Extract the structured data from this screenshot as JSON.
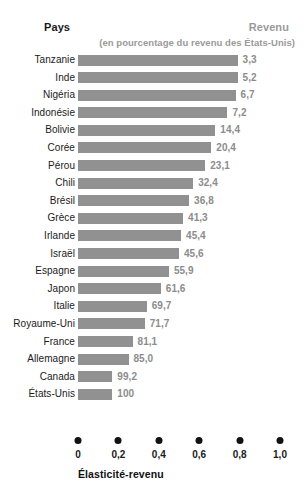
{
  "header": {
    "col_country": "Pays",
    "col_income": "Revenu",
    "col_income_sub": "(en pourcentage du revenu des États-Unis)"
  },
  "axis": {
    "title": "Élasticité-revenu",
    "ticks": [
      "0",
      "0,2",
      "0,4",
      "0,6",
      "0,8",
      "1,0"
    ],
    "tick_values": [
      0,
      0.2,
      0.4,
      0.6,
      0.8,
      1.0
    ]
  },
  "style": {
    "bar_color": "#919191",
    "value_color": "#8c8c8c",
    "label_color": "#1a1a1a",
    "header_muted_color": "#9a9a9a",
    "dot_color": "#111111",
    "background": "#ffffff"
  },
  "chart_data": {
    "type": "bar",
    "orientation": "horizontal",
    "title": "",
    "xlabel": "Élasticité-revenu",
    "ylabel": "Pays",
    "xlim": [
      0,
      1.0
    ],
    "grid": false,
    "legend": false,
    "categories": [
      "Tanzanie",
      "Inde",
      "Nigéria",
      "Indonésie",
      "Bolivie",
      "Corée",
      "Pérou",
      "Chili",
      "Brésil",
      "Grèce",
      "Irlande",
      "Israël",
      "Espagne",
      "Japon",
      "Italie",
      "Royaume-Uni",
      "France",
      "Allemagne",
      "Canada",
      "États-Unis"
    ],
    "values": [
      0.79,
      0.79,
      0.78,
      0.74,
      0.68,
      0.66,
      0.63,
      0.57,
      0.55,
      0.52,
      0.51,
      0.5,
      0.45,
      0.41,
      0.34,
      0.33,
      0.27,
      0.25,
      0.17,
      0.17
    ],
    "value_labels": [
      "3,3",
      "5,2",
      "6,7",
      "7,2",
      "14,4",
      "20,4",
      "23,1",
      "32,4",
      "36,8",
      "41,3",
      "45,4",
      "45,6",
      "55,9",
      "61,6",
      "69,7",
      "71,7",
      "81,1",
      "85,0",
      "99,2",
      "100"
    ],
    "value_label_meaning": "Revenu en pourcentage du revenu des États-Unis",
    "rows": [
      {
        "country": "Tanzanie",
        "elasticity": 0.79,
        "income_pct": "3,3"
      },
      {
        "country": "Inde",
        "elasticity": 0.79,
        "income_pct": "5,2"
      },
      {
        "country": "Nigéria",
        "elasticity": 0.78,
        "income_pct": "6,7"
      },
      {
        "country": "Indonésie",
        "elasticity": 0.74,
        "income_pct": "7,2"
      },
      {
        "country": "Bolivie",
        "elasticity": 0.68,
        "income_pct": "14,4"
      },
      {
        "country": "Corée",
        "elasticity": 0.66,
        "income_pct": "20,4"
      },
      {
        "country": "Pérou",
        "elasticity": 0.63,
        "income_pct": "23,1"
      },
      {
        "country": "Chili",
        "elasticity": 0.57,
        "income_pct": "32,4"
      },
      {
        "country": "Brésil",
        "elasticity": 0.55,
        "income_pct": "36,8"
      },
      {
        "country": "Grèce",
        "elasticity": 0.52,
        "income_pct": "41,3"
      },
      {
        "country": "Irlande",
        "elasticity": 0.51,
        "income_pct": "45,4"
      },
      {
        "country": "Israël",
        "elasticity": 0.5,
        "income_pct": "45,6"
      },
      {
        "country": "Espagne",
        "elasticity": 0.45,
        "income_pct": "55,9"
      },
      {
        "country": "Japon",
        "elasticity": 0.41,
        "income_pct": "61,6"
      },
      {
        "country": "Italie",
        "elasticity": 0.34,
        "income_pct": "69,7"
      },
      {
        "country": "Royaume-Uni",
        "elasticity": 0.33,
        "income_pct": "71,7"
      },
      {
        "country": "France",
        "elasticity": 0.27,
        "income_pct": "81,1"
      },
      {
        "country": "Allemagne",
        "elasticity": 0.25,
        "income_pct": "85,0"
      },
      {
        "country": "Canada",
        "elasticity": 0.17,
        "income_pct": "99,2"
      },
      {
        "country": "États-Unis",
        "elasticity": 0.17,
        "income_pct": "100"
      }
    ]
  }
}
